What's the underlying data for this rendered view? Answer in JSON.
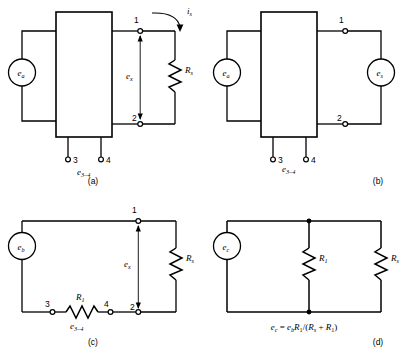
{
  "figure": {
    "line_color": "#000000",
    "background": "#ffffff"
  },
  "panels": [
    {
      "tag": "(a)",
      "name": "panel-a",
      "source_label": "e",
      "source_sub": "a",
      "terminal_1": "1",
      "terminal_2": "2",
      "terminal_3": "3",
      "terminal_4": "4",
      "voltage_label": "e",
      "voltage_sub": "x",
      "resistor_label": "R",
      "resistor_sub": "s",
      "current_label": "i",
      "current_sub": "s",
      "terminal_voltage_label": "e",
      "terminal_voltage_sub": "3–4"
    },
    {
      "tag": "(b)",
      "name": "panel-b",
      "source_label": "e",
      "source_sub": "a",
      "source2_label": "e",
      "source2_sub": "s",
      "terminal_1": "1",
      "terminal_2": "2",
      "terminal_3": "3",
      "terminal_4": "4",
      "terminal_voltage_label": "e",
      "terminal_voltage_sub": "3–4"
    },
    {
      "tag": "(c)",
      "name": "panel-c",
      "source_label": "e",
      "source_sub": "b",
      "terminal_1": "1",
      "terminal_2": "2",
      "terminal_3": "3",
      "terminal_4": "4",
      "voltage_label": "e",
      "voltage_sub": "x",
      "resistor_label": "R",
      "resistor_sub": "s",
      "resistor1_label": "R",
      "resistor1_sub": "1",
      "terminal_voltage_label": "e",
      "terminal_voltage_sub": "3–4"
    },
    {
      "tag": "(d)",
      "name": "panel-d",
      "source_label": "e",
      "source_sub": "c",
      "resistor1_label": "R",
      "resistor1_sub": "1",
      "resistor_label": "R",
      "resistor_sub": "s",
      "equation": {
        "lhs": "e",
        "lhs_sub": "c",
        "eq": " = ",
        "rhs_1": "e",
        "rhs_1_sub": "b",
        "rhs_2": "R",
        "rhs_2_sub": "1",
        "rhs_3": "/(",
        "rhs_4": "R",
        "rhs_4_sub": "s",
        "rhs_5": " + ",
        "rhs_6": "R",
        "rhs_6_sub": "1",
        "rhs_7": ")"
      }
    }
  ]
}
